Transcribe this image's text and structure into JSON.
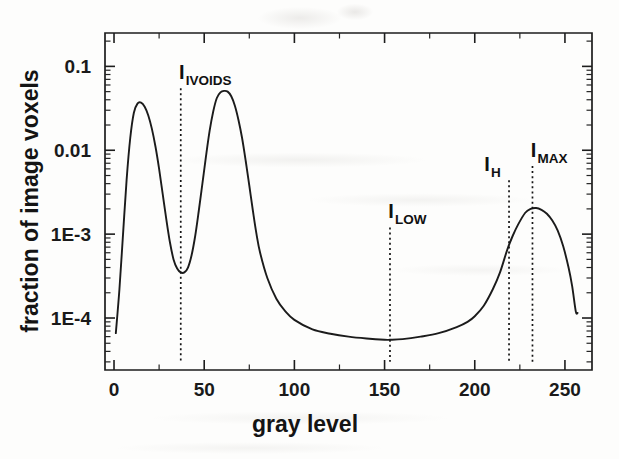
{
  "chart_data": {
    "type": "line",
    "title": "",
    "xlabel": "gray level",
    "ylabel": "fraction of image voxels",
    "xlim": [
      -5,
      265
    ],
    "ylim": [
      2.4e-05,
      0.25
    ],
    "yscale": "log",
    "grid": false,
    "legend": "none",
    "xticks": [
      0,
      50,
      100,
      150,
      200,
      250
    ],
    "xticklabels": [
      "0",
      "50",
      "100",
      "150",
      "200",
      "250"
    ],
    "yticks": [
      0.1,
      0.01,
      0.001,
      0.0001
    ],
    "yticklabels": [
      "0.1",
      "0.01",
      "1E-3",
      "1E-4"
    ],
    "series": [
      {
        "name": "gray level histogram",
        "x": [
          1,
          3,
          5,
          7,
          9,
          11,
          13,
          15,
          17,
          19,
          21,
          23,
          25,
          27,
          29,
          31,
          33,
          35,
          37,
          39,
          41,
          43,
          45,
          47,
          49,
          51,
          53,
          55,
          57,
          59,
          61,
          63,
          65,
          67,
          69,
          71,
          73,
          75,
          77,
          79,
          81,
          85,
          90,
          95,
          100,
          110,
          120,
          130,
          140,
          150,
          153,
          160,
          170,
          180,
          190,
          196,
          200,
          205,
          210,
          214,
          218,
          221,
          224,
          228,
          231,
          234,
          237,
          240,
          243,
          246,
          249,
          252,
          254,
          256,
          257
        ],
        "y": [
          6.6e-05,
          0.00022,
          0.001,
          0.0045,
          0.014,
          0.028,
          0.036,
          0.037,
          0.033,
          0.026,
          0.018,
          0.011,
          0.006,
          0.003,
          0.0015,
          0.0008,
          0.0005,
          0.00039,
          0.00035,
          0.00035,
          0.0004,
          0.00056,
          0.00095,
          0.0019,
          0.004,
          0.0085,
          0.017,
          0.029,
          0.042,
          0.049,
          0.051,
          0.05,
          0.044,
          0.034,
          0.023,
          0.014,
          0.0075,
          0.0038,
          0.0019,
          0.001,
          0.0006,
          0.0003,
          0.00017,
          0.00012,
          9.5e-05,
          7.3e-05,
          6.5e-05,
          6e-05,
          5.7e-05,
          5.5e-05,
          5.5e-05,
          5.6e-05,
          6e-05,
          6.6e-05,
          7.8e-05,
          9e-05,
          0.000105,
          0.00014,
          0.00022,
          0.00035,
          0.00065,
          0.00095,
          0.0013,
          0.0018,
          0.002,
          0.00205,
          0.00195,
          0.00175,
          0.00145,
          0.0011,
          0.00072,
          0.0004,
          0.00024,
          0.00012,
          0.000115
        ]
      }
    ],
    "annotations": [
      {
        "id": "ivoids",
        "symbol": "I",
        "subscript": "IVOIDS",
        "x": 37,
        "y_top": 0.055,
        "y_bottom": 3e-05,
        "label_anchor": "start"
      },
      {
        "id": "low",
        "symbol": "I",
        "subscript": "LOW",
        "x": 153,
        "y_top": 0.0012,
        "y_bottom": 3e-05,
        "label_anchor": "start"
      },
      {
        "id": "h",
        "symbol": "I",
        "subscript": "H",
        "x": 219,
        "y_top": 0.0044,
        "y_bottom": 3e-05,
        "label_anchor": "end"
      },
      {
        "id": "max",
        "symbol": "I",
        "subscript": "MAX",
        "x": 232,
        "y_top": 0.0065,
        "y_bottom": 3e-05,
        "label_anchor": "start"
      }
    ]
  },
  "axes": {
    "x_title": "gray level",
    "y_title": "fraction of image voxels",
    "x_tick_labels": [
      "0",
      "50",
      "100",
      "150",
      "200",
      "250"
    ],
    "y_tick_labels": [
      "0.1",
      "0.01",
      "1E-3",
      "1E-4"
    ]
  },
  "markers": {
    "ivoids": {
      "main": "I",
      "sub": "IVOIDS"
    },
    "low": {
      "main": "I",
      "sub": "LOW"
    },
    "h": {
      "main": "I",
      "sub": "H"
    },
    "max": {
      "main": "I",
      "sub": "MAX"
    }
  },
  "colors": {
    "curve": "#1b1b1b",
    "axis": "#1d1d1d",
    "marker": "#141414",
    "background": "#fdfdfc"
  }
}
